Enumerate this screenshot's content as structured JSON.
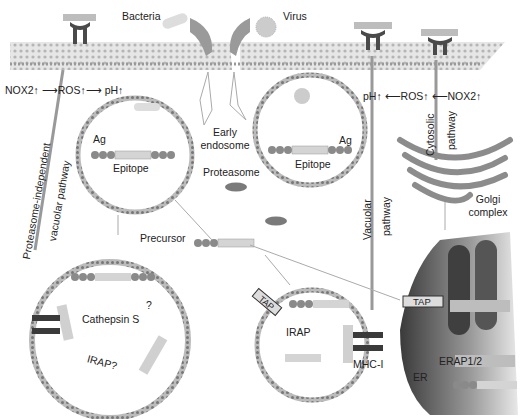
{
  "diagram": {
    "labels": {
      "bacteria": "Bacteria",
      "virus": "Virus",
      "nox_left": "NOX2↑ ⟶ROS↑⟶ pH↑",
      "nox_right": "pH↑ ⟵ROS↑ ⟵NOX2↑",
      "ag_left": "Ag",
      "ag_right": "Ag",
      "epitope_left": "Epitope",
      "epitope_right": "Epitope",
      "early_endosome_1": "Early",
      "early_endosome_2": "endosome",
      "proteasome": "Proteasome",
      "precursor": "Precursor",
      "proteasome_independent": "Proteasome-independent",
      "vacuolar_pathway_left": "vacuolar pathway",
      "vacuolar": "Vacuolar",
      "pathway_mid": "pathway",
      "cytosolic": "Cytosolic",
      "pathway_right": "pathway",
      "golgi_1": "Golgi",
      "golgi_2": "complex",
      "cathepsin": "Cathepsin S",
      "question": "?",
      "irap_q": "IRAP?",
      "tap_left": "TAP",
      "tap_right": "TAP",
      "irap": "IRAP",
      "mhc": "MHC-I",
      "erap": "ERAP1/2",
      "er": "ER"
    },
    "colors": {
      "membrane": "#c9c9c9",
      "receptor": "#4a4a4a",
      "bead": "#8a8a8a",
      "peptide": "#d4d4d4",
      "golgi": "#8c8c8c",
      "er_dark": "#5a5a5a"
    }
  }
}
